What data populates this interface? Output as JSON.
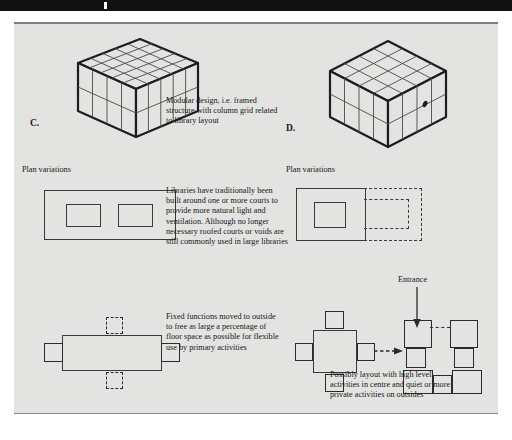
{
  "page": {
    "background_color": "#e3e3e1",
    "ink_color": "#171717",
    "topbar_color": "#111111"
  },
  "figures": {
    "c": {
      "label": "C.",
      "plan_caption": "Plan variations",
      "type": "isometric-slab-block",
      "grid_cols": 5,
      "grid_rows": 2,
      "grid_depth": 3
    },
    "d": {
      "label": "D.",
      "plan_caption": "Plan variations",
      "type": "isometric-cube-block",
      "grid_cols": 4,
      "grid_rows": 2,
      "grid_depth": 4
    }
  },
  "captions": {
    "modular": "Modular design, i.e. framed structure with column grid related to library layout",
    "courts": "Libraries have traditionally been built around one or more courts to provide more natural light and ventilation. Although no longer necessary roofed courts or voids are still commonly used in large libraries",
    "fixed_functions": "Fixed functions moved to outside to free as large a percentage of floor space as possible for flexible use by primary activities",
    "possible_layout": "Possibly layout with high level activities in centre and quiet or more private activities on outsides"
  },
  "annotations": {
    "entrance": "Entrance"
  },
  "diagrams": {
    "c_plan_courts": {
      "name": "rectangular-plan-two-courts",
      "outer": "solid rectangle",
      "courts": 2
    },
    "d_plan_courts": {
      "name": "square-plan-single-court-with-dashed-extension",
      "outer": "solid square",
      "courts": 1,
      "extension": "dashed"
    },
    "c_plan_fixed": {
      "name": "rectangular-plan-peripheral-functions",
      "solid_satellites": 2,
      "dashed_satellites": 2
    },
    "d_plan_fixed": {
      "name": "square-plan-peripheral-functions",
      "solid_satellites": 4
    },
    "d_plan_cluster": {
      "name": "clustered-block-layout",
      "blocks": 7
    }
  }
}
